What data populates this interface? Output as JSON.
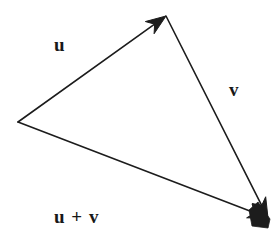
{
  "figure": {
    "background_color": "#ffffff",
    "stroke_color": "#1c1c1c",
    "text_color": "#181818",
    "stroke_width": 1.6
  },
  "labels": {
    "u": "u",
    "v": "v",
    "u_plus_v": "u + v"
  },
  "chart_data": {
    "type": "diagram",
    "vertices": {
      "tail": [
        18,
        122
      ],
      "head_u": [
        166,
        16
      ],
      "head_v": [
        268,
        218
      ]
    },
    "vectors": [
      {
        "name": "u",
        "label": "u",
        "from": [
          18,
          122
        ],
        "to": [
          166,
          16
        ],
        "arrowhead": "filled-triangle",
        "label_position": [
          57,
          45
        ]
      },
      {
        "name": "v",
        "label": "v",
        "from": [
          166,
          16
        ],
        "to": [
          268,
          218
        ],
        "arrowhead": "filled-triangle",
        "label_position": [
          236,
          90
        ]
      },
      {
        "name": "u+v",
        "label": "u + v",
        "from": [
          18,
          122
        ],
        "to": [
          268,
          218
        ],
        "arrowhead": "filled-triangle",
        "label_position": [
          82,
          217
        ]
      }
    ]
  }
}
